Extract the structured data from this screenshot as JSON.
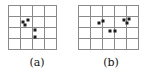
{
  "figure": {
    "type": "point-pattern-grid-diagram",
    "background_color": "#ffffff",
    "gridline_color": "#8a8a8a",
    "dot_color": "#1a1a1a",
    "panels": [
      {
        "id": "a",
        "caption": "(a)",
        "grid": {
          "cols": 4,
          "rows": 4,
          "cell_width": 12,
          "cell_height": 11
        },
        "dots": [
          {
            "x": 15.0,
            "y": 16.5
          },
          {
            "x": 19.5,
            "y": 15.0
          },
          {
            "x": 17.0,
            "y": 19.5
          },
          {
            "x": 27.0,
            "y": 24.5
          },
          {
            "x": 27.0,
            "y": 32.0
          }
        ],
        "dot_count": 5
      },
      {
        "id": "b",
        "caption": "(b)",
        "grid": {
          "cols": 5,
          "rows": 4,
          "cell_width": 12,
          "cell_height": 11
        },
        "dots": [
          {
            "x": 21.0,
            "y": 17.5
          },
          {
            "x": 24.5,
            "y": 15.5
          },
          {
            "x": 46.0,
            "y": 15.0
          },
          {
            "x": 50.5,
            "y": 14.0
          },
          {
            "x": 49.0,
            "y": 18.0
          },
          {
            "x": 31.5,
            "y": 26.0
          },
          {
            "x": 37.0,
            "y": 26.0
          }
        ],
        "dot_count": 7
      }
    ]
  }
}
